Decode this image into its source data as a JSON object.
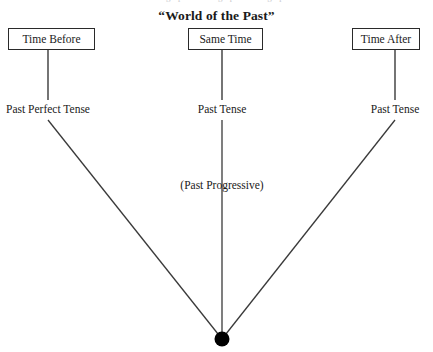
{
  "top_clipped_text": "an in ngn  pa  n  n  m  ngn   p  an  nm  ngn  pan",
  "title": "“World of the Past”",
  "nodes": [
    {
      "id": "time-before",
      "label": "Time Before"
    },
    {
      "id": "same-time",
      "label": "Same Time"
    },
    {
      "id": "time-after",
      "label": "Time After"
    }
  ],
  "tense_labels": [
    {
      "id": "left",
      "label": "Past Perfect Tense"
    },
    {
      "id": "center",
      "label": "Past Tense"
    },
    {
      "id": "right",
      "label": "Past Tense"
    }
  ],
  "aspect_label": "(Past Progressive)",
  "colors": {
    "background": "#ffffff",
    "ink": "#1a1a1a",
    "line": "#3a3a3a",
    "box_border": "#2a2a2a",
    "vertex_dot": "#000000"
  },
  "diagram_data": {
    "type": "converging-lines",
    "vertex": {
      "x": 222,
      "y": 339,
      "radius": 7
    },
    "columns": [
      {
        "id": "left",
        "x": 48,
        "box_bottom_y": 50,
        "stub_end_y": 100,
        "line_start_y": 120
      },
      {
        "id": "center",
        "x": 222,
        "box_bottom_y": 50,
        "stub_end_y": 100,
        "line_start_y": 120
      },
      {
        "id": "right",
        "x": 395,
        "box_bottom_y": 50,
        "stub_end_y": 100,
        "line_start_y": 120
      }
    ]
  }
}
